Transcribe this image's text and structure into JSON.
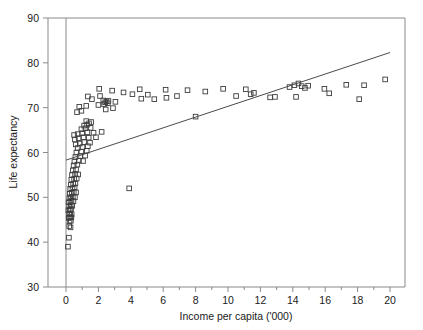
{
  "chart_data": {
    "type": "scatter",
    "title": "",
    "xlabel": "Income per capita ('000)",
    "ylabel": "Life expectancy",
    "xlim": [
      -1.1,
      21.0
    ],
    "ylim": [
      30,
      90
    ],
    "xticks": [
      0,
      2,
      4,
      6,
      8,
      10,
      12,
      14,
      16,
      18,
      20
    ],
    "xtick_labels": [
      "0",
      "2",
      "4",
      "6",
      "8",
      "10",
      "12",
      "14",
      "16",
      "18",
      "20"
    ],
    "xminor_ticks": [
      1,
      3,
      5,
      7,
      9,
      11,
      13,
      15,
      17,
      19
    ],
    "yticks": [
      30,
      40,
      50,
      60,
      70,
      80,
      90
    ],
    "ytick_labels": [
      "30",
      "40",
      "50",
      "60",
      "70",
      "80",
      "90"
    ],
    "grid": false,
    "legend": null,
    "marker": "open-square",
    "marker_color": "#3d3d3d",
    "frame_color": "#8a8a8a",
    "vertical_reference_line_x": 0,
    "trend_line": {
      "label": "regression line",
      "x_start": 0.0,
      "y_start": 58.3,
      "x_end": 20.0,
      "y_end": 82.3,
      "color": "#4a4a4a"
    },
    "points": [
      [
        0.12,
        39.0
      ],
      [
        0.18,
        41.0
      ],
      [
        0.2,
        43.6
      ],
      [
        0.28,
        43.3
      ],
      [
        0.22,
        44.6
      ],
      [
        0.3,
        44.8
      ],
      [
        0.17,
        45.4
      ],
      [
        0.25,
        45.6
      ],
      [
        0.33,
        45.5
      ],
      [
        0.19,
        46.3
      ],
      [
        0.26,
        46.4
      ],
      [
        0.35,
        46.2
      ],
      [
        0.15,
        47.1
      ],
      [
        0.24,
        47.2
      ],
      [
        0.31,
        47.4
      ],
      [
        0.2,
        48.0
      ],
      [
        0.29,
        48.2
      ],
      [
        0.38,
        48.1
      ],
      [
        0.16,
        48.9
      ],
      [
        0.27,
        49.0
      ],
      [
        0.34,
        49.2
      ],
      [
        0.46,
        49.1
      ],
      [
        0.21,
        49.8
      ],
      [
        0.31,
        50.0
      ],
      [
        0.42,
        50.1
      ],
      [
        0.55,
        50.0
      ],
      [
        0.23,
        50.8
      ],
      [
        0.36,
        51.0
      ],
      [
        0.48,
        51.2
      ],
      [
        0.62,
        51.1
      ],
      [
        0.26,
        51.9
      ],
      [
        0.4,
        52.0
      ],
      [
        0.53,
        52.2
      ],
      [
        3.9,
        52.0
      ],
      [
        0.3,
        52.8
      ],
      [
        0.44,
        53.0
      ],
      [
        0.58,
        53.1
      ],
      [
        0.33,
        53.9
      ],
      [
        0.5,
        54.1
      ],
      [
        0.66,
        54.2
      ],
      [
        0.37,
        55.0
      ],
      [
        0.56,
        55.2
      ],
      [
        0.75,
        55.1
      ],
      [
        0.42,
        56.0
      ],
      [
        0.62,
        56.2
      ],
      [
        0.47,
        57.1
      ],
      [
        0.7,
        57.3
      ],
      [
        0.52,
        58.0
      ],
      [
        0.8,
        58.2
      ],
      [
        1.05,
        58.1
      ],
      [
        0.58,
        59.0
      ],
      [
        0.88,
        59.2
      ],
      [
        1.18,
        59.3
      ],
      [
        0.64,
        60.0
      ],
      [
        0.95,
        60.2
      ],
      [
        1.28,
        60.4
      ],
      [
        0.72,
        61.0
      ],
      [
        1.02,
        61.2
      ],
      [
        1.35,
        61.4
      ],
      [
        0.6,
        61.8
      ],
      [
        0.85,
        62.0
      ],
      [
        1.12,
        62.3
      ],
      [
        1.48,
        62.2
      ],
      [
        0.55,
        62.9
      ],
      [
        0.78,
        63.2
      ],
      [
        1.08,
        63.4
      ],
      [
        1.4,
        63.3
      ],
      [
        1.85,
        63.4
      ],
      [
        0.5,
        63.9
      ],
      [
        0.72,
        64.1
      ],
      [
        1.0,
        64.3
      ],
      [
        1.32,
        64.5
      ],
      [
        1.7,
        64.4
      ],
      [
        2.2,
        64.6
      ],
      [
        0.95,
        65.2
      ],
      [
        1.2,
        65.4
      ],
      [
        1.52,
        65.5
      ],
      [
        1.12,
        66.0
      ],
      [
        1.3,
        66.2
      ],
      [
        1.42,
        66.5
      ],
      [
        1.25,
        67.0
      ],
      [
        1.55,
        66.8
      ],
      [
        0.68,
        69.0
      ],
      [
        0.95,
        69.3
      ],
      [
        2.45,
        69.6
      ],
      [
        2.9,
        69.9
      ],
      [
        0.82,
        70.2
      ],
      [
        1.25,
        70.4
      ],
      [
        2.0,
        70.6
      ],
      [
        2.35,
        70.8
      ],
      [
        2.42,
        71.2
      ],
      [
        2.5,
        71.4
      ],
      [
        2.58,
        71.0
      ],
      [
        2.62,
        71.5
      ],
      [
        2.3,
        71.6
      ],
      [
        1.6,
        71.9
      ],
      [
        3.05,
        71.3
      ],
      [
        1.35,
        72.5
      ],
      [
        2.1,
        72.6
      ],
      [
        4.65,
        72.0
      ],
      [
        5.45,
        71.9
      ],
      [
        6.2,
        72.2
      ],
      [
        4.1,
        73.0
      ],
      [
        5.05,
        72.9
      ],
      [
        6.85,
        72.6
      ],
      [
        2.05,
        74.2
      ],
      [
        2.85,
        73.8
      ],
      [
        3.55,
        73.4
      ],
      [
        4.55,
        74.1
      ],
      [
        6.15,
        74.0
      ],
      [
        7.5,
        73.9
      ],
      [
        8.6,
        73.6
      ],
      [
        8.0,
        68.0
      ],
      [
        9.7,
        74.2
      ],
      [
        10.5,
        72.6
      ],
      [
        11.1,
        74.1
      ],
      [
        11.4,
        73.0
      ],
      [
        11.6,
        73.3
      ],
      [
        12.6,
        72.3
      ],
      [
        12.9,
        72.4
      ],
      [
        13.8,
        74.6
      ],
      [
        14.1,
        75.0
      ],
      [
        14.35,
        75.4
      ],
      [
        14.55,
        74.8
      ],
      [
        14.75,
        74.4
      ],
      [
        14.95,
        74.9
      ],
      [
        14.2,
        72.4
      ],
      [
        15.95,
        74.2
      ],
      [
        16.25,
        73.2
      ],
      [
        17.3,
        75.1
      ],
      [
        18.4,
        75.0
      ],
      [
        18.1,
        71.9
      ],
      [
        19.7,
        76.3
      ]
    ]
  }
}
